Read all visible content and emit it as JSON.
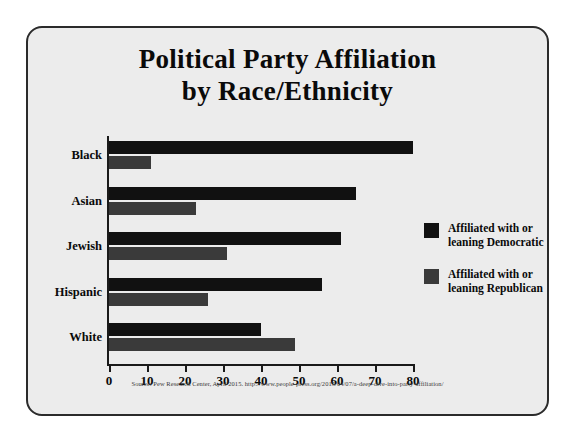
{
  "card": {
    "title_line1": "Political Party Affiliation",
    "title_line2": "by Race/Ethnicity",
    "source": "Source: Pew Research Center, April 2015. http://www.people-press.org/2015/04/07/a-deep-dive-into-party-affiliation/"
  },
  "legend": {
    "items": [
      {
        "line1": "Affiliated with or",
        "line2": "leaning Democratic",
        "color": "#111111",
        "swatch_name": "legend-swatch-democratic"
      },
      {
        "line1": "Affiliated with or",
        "line2": "leaning Republican",
        "color": "#3a3a3a",
        "swatch_name": "legend-swatch-republican"
      }
    ]
  },
  "chart_data": {
    "type": "bar",
    "orientation": "horizontal",
    "title": "Political Party Affiliation by Race/Ethnicity",
    "xlabel": "",
    "ylabel": "",
    "xlim": [
      0,
      80
    ],
    "xticks": [
      0,
      10,
      20,
      30,
      40,
      50,
      60,
      70,
      80
    ],
    "grid": false,
    "legend_position": "right",
    "categories": [
      "Black",
      "Asian",
      "Jewish",
      "Hispanic",
      "White"
    ],
    "series": [
      {
        "name": "Affiliated with or leaning Democratic",
        "color": "#111111",
        "values": [
          80,
          65,
          61,
          56,
          40
        ]
      },
      {
        "name": "Affiliated with or leaning Republican",
        "color": "#3a3a3a",
        "values": [
          11,
          23,
          31,
          26,
          49
        ]
      }
    ]
  }
}
